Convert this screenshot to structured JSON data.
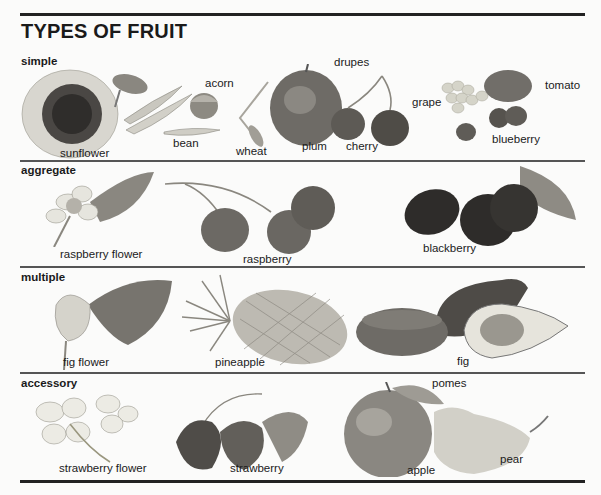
{
  "title": "TYPES OF FRUIT",
  "sections": [
    {
      "label": "simple",
      "items": [
        "sunflower",
        "bean",
        "acorn",
        "wheat",
        "drupes",
        "plum",
        "cherry",
        "grape",
        "tomato",
        "blueberry"
      ]
    },
    {
      "label": "aggregate",
      "items": [
        "raspberry flower",
        "raspberry",
        "blackberry"
      ]
    },
    {
      "label": "multiple",
      "items": [
        "fig flower",
        "pineapple",
        "fig"
      ]
    },
    {
      "label": "accessory",
      "items": [
        "strawberry flower",
        "strawberry",
        "pomes",
        "apple",
        "pear"
      ]
    }
  ],
  "colors": {
    "rule": "#222222",
    "text": "#1a1a1a",
    "background": "#fbfbfa"
  }
}
